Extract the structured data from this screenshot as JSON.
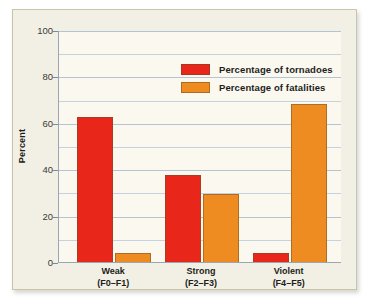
{
  "chart_data": {
    "type": "bar",
    "title": "",
    "xlabel": "",
    "ylabel": "Percent",
    "ylim": [
      0,
      100
    ],
    "yticks": [
      0,
      20,
      40,
      60,
      80,
      100
    ],
    "ytick_labels": [
      "0",
      "20",
      "40",
      "60",
      "80",
      "100"
    ],
    "minor_gridlines": [
      10,
      30,
      50,
      70,
      90
    ],
    "grid": true,
    "legend_position": "top-center",
    "categories": [
      "Weak\n(F0–F1)",
      "Strong\n(F2–F3)",
      "Violent\n(F4–F5)"
    ],
    "category_lines": [
      {
        "line1": "Weak",
        "line2": "(F0–F1)"
      },
      {
        "line1": "Strong",
        "line2": "(F2–F3)"
      },
      {
        "line1": "Violent",
        "line2": "(F4–F5)"
      }
    ],
    "series": [
      {
        "name": "Percentage of tornadoes",
        "color": "#e8271a",
        "values": [
          62.5,
          37.5,
          4.0
        ]
      },
      {
        "name": "Percentage of fatalities",
        "color": "#ee8b21",
        "values": [
          4.0,
          29.5,
          68.0
        ]
      }
    ]
  },
  "legend": {
    "items": [
      {
        "label": "Percentage of tornadoes",
        "color": "#e8271a"
      },
      {
        "label": "Percentage of fatalities",
        "color": "#ee8b21"
      }
    ]
  },
  "axis": {
    "y_title": "Percent",
    "y_tick_labels": [
      "100",
      "80",
      "60",
      "40",
      "20",
      "0"
    ]
  },
  "colors": {
    "red": "#e8271a",
    "orange": "#ee8b21",
    "card_background": "#f2f0e4",
    "plot_background": "#faf8ef",
    "gridline": "#c3d2de",
    "axis": "#9aa7b2"
  }
}
